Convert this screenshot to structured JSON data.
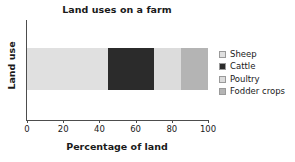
{
  "chart_data": {
    "type": "bar",
    "orientation": "horizontal",
    "stacked": true,
    "title": "Land uses on a farm",
    "xlabel": "Percentage of land",
    "ylabel": "Land use",
    "xlim": [
      0,
      100
    ],
    "xticks": [
      0,
      20,
      40,
      60,
      80,
      100
    ],
    "xtick_labels": [
      "0",
      "20",
      "40",
      "60",
      "80",
      "100"
    ],
    "grid": false,
    "legend_position": "right",
    "categories": [
      "Land use"
    ],
    "series": [
      {
        "name": "Sheep",
        "values": [
          45
        ],
        "start": 0,
        "end": 45,
        "color": "#e0e0e0"
      },
      {
        "name": "Cattle",
        "values": [
          25
        ],
        "start": 45,
        "end": 70,
        "color": "#2b2b2b"
      },
      {
        "name": "Poultry",
        "values": [
          15
        ],
        "start": 70,
        "end": 85,
        "color": "#dcdcdc"
      },
      {
        "name": "Fodder crops",
        "values": [
          15
        ],
        "start": 85,
        "end": 100,
        "color": "#b4b4b4"
      }
    ]
  },
  "legend": {
    "items": [
      {
        "label": "Sheep",
        "color": "#e0e0e0"
      },
      {
        "label": "Cattle",
        "color": "#2b2b2b"
      },
      {
        "label": "Poultry",
        "color": "#dcdcdc"
      },
      {
        "label": "Fodder crops",
        "color": "#b4b4b4"
      }
    ]
  }
}
